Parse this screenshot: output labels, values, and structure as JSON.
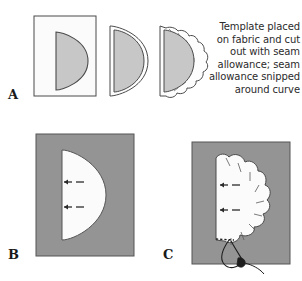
{
  "figure": {
    "title": "Template placed on fabric and cut out with seam allowance; seam allowance snipped around curve",
    "background_color": "#ffffff",
    "panels": [
      {
        "id": "A",
        "label": "A",
        "description": "Template on paper, template cut with seam allowance, seam allowance snipped around curve",
        "caption": "Template placed on fabric and cut out with seam allowance; seam allowance snipped around curve"
      },
      {
        "id": "B",
        "label": "B",
        "description": "Template pinned to gray fabric rectangle with two basting arrow marks"
      },
      {
        "id": "C",
        "label": "C",
        "description": "Seam allowance snipped around curve, basted with needle and thread"
      }
    ],
    "colors": {
      "fabric_gray": "#949494",
      "template_gray": "#c9c9c9",
      "paper_white": "#fcfcfc",
      "outline": "#3a3a3a",
      "text": "#2b2b2b",
      "label": "#1a1a1a",
      "thread": "#1e1e1e"
    }
  },
  "caption": {
    "line1": "Template placed",
    "line2": "on fabric and cut",
    "line3": "out with seam",
    "line4": "allowance; seam",
    "line5": "allowance snipped",
    "line6": "around curve",
    "full": "Template placed on fabric and cut out with seam allowance; seam allowance snipped around curve"
  },
  "labels": {
    "a": "A",
    "b": "B",
    "c": "C"
  }
}
